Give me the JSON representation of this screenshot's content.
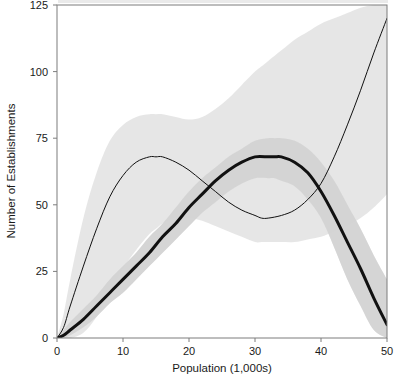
{
  "chart_data": {
    "type": "line",
    "title": "",
    "title_note": "chart title is cropped off at the top edge and illegible",
    "xlabel": "Population (1,000s)",
    "ylabel": "Number of Establishments",
    "xlim": [
      0,
      50
    ],
    "ylim": [
      0,
      125
    ],
    "xticks": [
      0,
      10,
      20,
      30,
      40,
      50
    ],
    "yticks": [
      0,
      25,
      50,
      75,
      100,
      125
    ],
    "xtick_labels": [
      "0",
      "10",
      "20",
      "30",
      "40",
      "50"
    ],
    "ytick_labels": [
      "0",
      "25",
      "50",
      "75",
      "100",
      "125"
    ],
    "grid": false,
    "legend": "none",
    "frame": "box",
    "band_color_outer": "#e2e2e2",
    "band_color_inner": "#cbcbcb",
    "line_color": "#111111",
    "background": "#ffffff",
    "series": [
      {
        "name": "thin-curve",
        "style": "thin",
        "linewidth": 1,
        "x": [
          0,
          1,
          2,
          4,
          6,
          8,
          10,
          12,
          14,
          15,
          16,
          18,
          20,
          22,
          24,
          26,
          28,
          30,
          31,
          32,
          34,
          36,
          38,
          40,
          42,
          44,
          46,
          48,
          50
        ],
        "values": [
          0,
          4,
          12,
          27,
          41,
          53,
          61,
          66,
          68,
          68,
          68,
          66,
          63,
          59,
          55,
          51,
          48,
          46,
          45,
          45,
          46,
          48,
          52,
          58,
          68,
          80,
          93,
          107,
          120
        ],
        "band_lower": [
          0,
          0,
          0,
          2,
          8,
          17,
          26,
          33,
          39,
          41,
          43,
          45,
          45,
          44,
          42,
          40,
          38,
          36,
          36,
          36,
          36,
          36,
          37,
          38,
          40,
          42,
          45,
          49,
          54
        ],
        "band_upper": [
          0,
          9,
          22,
          45,
          62,
          74,
          80,
          83,
          84,
          84,
          84,
          83,
          82,
          83,
          86,
          90,
          95,
          100,
          102,
          104,
          108,
          112,
          115,
          118,
          120,
          122,
          124,
          125,
          125
        ]
      },
      {
        "name": "thick-curve",
        "style": "thick",
        "linewidth": 3,
        "x": [
          0,
          1,
          2,
          4,
          6,
          8,
          10,
          12,
          14,
          16,
          18,
          20,
          22,
          24,
          26,
          28,
          30,
          32,
          33,
          34,
          36,
          38,
          40,
          42,
          44,
          46,
          48,
          50
        ],
        "values": [
          0,
          1,
          3,
          7,
          12,
          17,
          22,
          27,
          32,
          38,
          43,
          49,
          54,
          59,
          63,
          66,
          68,
          68,
          68,
          68,
          66,
          62,
          55,
          46,
          36,
          26,
          15,
          5
        ],
        "band_lower": [
          0,
          0,
          1,
          4,
          8,
          13,
          17,
          22,
          27,
          32,
          37,
          42,
          47,
          51,
          55,
          58,
          60,
          60,
          60,
          59,
          57,
          52,
          45,
          34,
          22,
          12,
          3,
          0
        ],
        "band_upper": [
          0,
          3,
          6,
          11,
          16,
          22,
          27,
          32,
          38,
          43,
          49,
          55,
          60,
          64,
          68,
          71,
          74,
          75,
          75,
          75,
          74,
          71,
          66,
          59,
          50,
          41,
          31,
          22
        ]
      }
    ]
  },
  "axes": {
    "y_axis_title": "Number of Establishments",
    "x_axis_title": "Population (1,000s)"
  }
}
